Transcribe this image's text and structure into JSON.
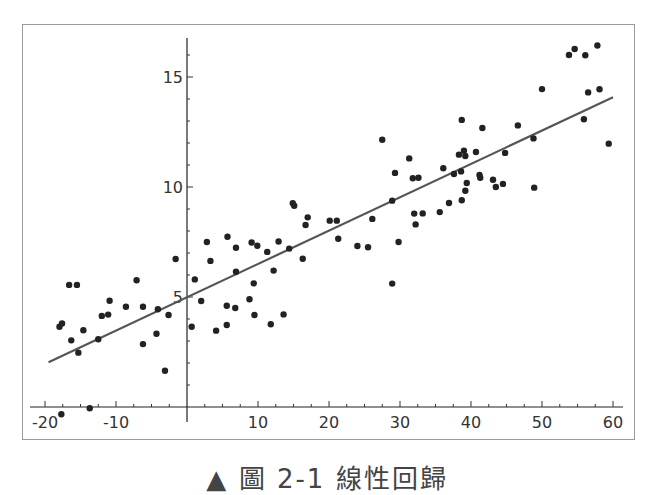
{
  "chart_data": {
    "type": "scatter",
    "title": "",
    "xlabel": "",
    "ylabel": "",
    "xlim": [
      -21,
      61
    ],
    "ylim": [
      -0.5,
      17
    ],
    "x_ticks": [
      -20,
      -10,
      10,
      20,
      30,
      40,
      50,
      60
    ],
    "y_ticks": [
      5,
      10,
      15
    ],
    "grid": false,
    "legend": null,
    "series": [
      {
        "name": "data points",
        "type": "scatter",
        "color": "#222222",
        "points": [
          [
            -17.96,
            3.65
          ],
          [
            -17.6,
            3.8
          ],
          [
            -16.6,
            5.55
          ],
          [
            -15.5,
            5.55
          ],
          [
            -16.3,
            3.03
          ],
          [
            -15.3,
            2.47
          ],
          [
            -14.6,
            3.49
          ],
          [
            -12.5,
            3.08
          ],
          [
            -12.0,
            4.14
          ],
          [
            -11.1,
            4.2
          ],
          [
            -10.9,
            4.83
          ],
          [
            -8.6,
            4.56
          ],
          [
            -7.1,
            5.76
          ],
          [
            -6.2,
            4.56
          ],
          [
            -6.2,
            2.86
          ],
          [
            -4.3,
            3.33
          ],
          [
            -4.1,
            4.44
          ],
          [
            -3.1,
            1.65
          ],
          [
            -2.6,
            4.18
          ],
          [
            -1.6,
            6.73
          ],
          [
            -13.7,
            -0.06
          ],
          [
            -17.7,
            -0.33
          ],
          [
            1.1,
            5.8
          ],
          [
            2.0,
            4.82
          ],
          [
            0.66,
            3.65
          ],
          [
            2.8,
            7.5
          ],
          [
            3.3,
            6.64
          ],
          [
            4.1,
            3.47
          ],
          [
            5.7,
            7.74
          ],
          [
            6.9,
            7.24
          ],
          [
            6.9,
            6.15
          ],
          [
            5.6,
            4.6
          ],
          [
            5.6,
            3.73
          ],
          [
            6.8,
            4.5
          ],
          [
            9.1,
            7.48
          ],
          [
            9.9,
            7.33
          ],
          [
            11.3,
            7.05
          ],
          [
            12.2,
            6.2
          ],
          [
            12.9,
            7.52
          ],
          [
            14.4,
            7.2
          ],
          [
            9.4,
            5.62
          ],
          [
            8.8,
            4.9
          ],
          [
            9.5,
            4.18
          ],
          [
            11.8,
            3.76
          ],
          [
            13.6,
            4.21
          ],
          [
            14.9,
            9.26
          ],
          [
            15.1,
            9.15
          ],
          [
            16.3,
            6.74
          ],
          [
            16.7,
            8.27
          ],
          [
            17.0,
            8.62
          ],
          [
            20.1,
            8.47
          ],
          [
            21.1,
            8.47
          ],
          [
            21.3,
            7.65
          ],
          [
            26.1,
            8.55
          ],
          [
            24.0,
            7.32
          ],
          [
            25.5,
            7.26
          ],
          [
            28.9,
            5.61
          ],
          [
            28.9,
            9.38
          ],
          [
            29.8,
            7.5
          ],
          [
            27.5,
            12.15
          ],
          [
            29.3,
            10.64
          ],
          [
            31.3,
            11.3
          ],
          [
            31.8,
            10.4
          ],
          [
            32.6,
            10.42
          ],
          [
            32.0,
            8.79
          ],
          [
            33.2,
            8.8
          ],
          [
            32.2,
            8.3
          ],
          [
            35.6,
            8.86
          ],
          [
            36.1,
            10.85
          ],
          [
            36.9,
            9.27
          ],
          [
            37.6,
            10.59
          ],
          [
            38.3,
            11.47
          ],
          [
            38.6,
            10.71
          ],
          [
            38.7,
            9.4
          ],
          [
            39.2,
            9.83
          ],
          [
            39.4,
            10.18
          ],
          [
            39.0,
            11.65
          ],
          [
            39.2,
            11.41
          ],
          [
            38.7,
            13.05
          ],
          [
            41.6,
            12.68
          ],
          [
            40.7,
            11.59
          ],
          [
            41.2,
            10.55
          ],
          [
            41.3,
            10.42
          ],
          [
            43.1,
            10.33
          ],
          [
            43.5,
            10.0
          ],
          [
            44.5,
            10.14
          ],
          [
            44.8,
            11.55
          ],
          [
            46.6,
            12.8
          ],
          [
            48.8,
            12.21
          ],
          [
            48.9,
            9.97
          ],
          [
            50.0,
            14.45
          ],
          [
            53.8,
            16.0
          ],
          [
            54.6,
            16.27
          ],
          [
            56.1,
            15.99
          ],
          [
            57.8,
            16.43
          ],
          [
            55.9,
            13.08
          ],
          [
            56.5,
            14.3
          ],
          [
            58.1,
            14.44
          ],
          [
            59.4,
            11.97
          ]
        ]
      },
      {
        "name": "regression line",
        "type": "line",
        "color": "#555555",
        "points": [
          [
            -19.5,
            2.03
          ],
          [
            60.0,
            14.08
          ]
        ]
      }
    ]
  },
  "caption": "▲ 圖 2-1 線性回歸"
}
